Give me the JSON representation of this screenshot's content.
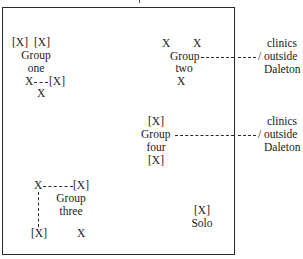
{
  "diagram": {
    "groups": {
      "one": {
        "top_row": [
          "[X]",
          "[X]"
        ],
        "label_line1": "Group",
        "label_line2": "one",
        "link_left": "X",
        "link_dashes": "----",
        "link_right": "[X]",
        "bottom": "X"
      },
      "two": {
        "top_row": [
          "X",
          "X"
        ],
        "label_line1": "Group",
        "label_line2": "two",
        "bottom": "X",
        "external": {
          "line1": "clinics",
          "line2": "/ outside",
          "line3": "Daleton"
        }
      },
      "four": {
        "top": "[X]",
        "label_line1": "Group",
        "label_line2": "four",
        "bottom": "[X]",
        "external": {
          "line1": "clinics",
          "line2": "/ outside",
          "line3": "Daleton"
        }
      },
      "three": {
        "link_left": "X",
        "link_right": "[X]",
        "label_line1": "Group",
        "label_line2": "three",
        "bottom_left": "[X]",
        "bottom_right": "X"
      },
      "solo": {
        "top": "[X]",
        "label": "Solo"
      }
    }
  }
}
